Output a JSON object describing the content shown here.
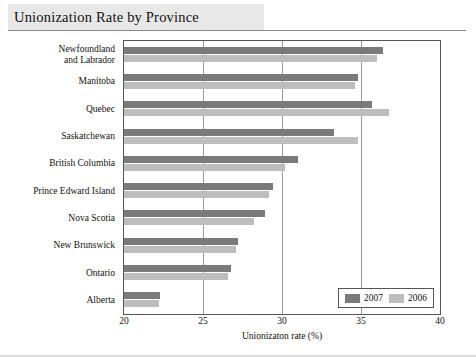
{
  "header": {
    "title": "Unionization Rate by Province"
  },
  "legend": {
    "items": [
      {
        "label": "2007",
        "color": "#7a7a7a"
      },
      {
        "label": "2006",
        "color": "#bdbdbd"
      }
    ]
  },
  "chart_data": {
    "type": "bar",
    "orientation": "horizontal",
    "title": "Unionization Rate by Province",
    "xlabel": "Unionizaton rate (%)",
    "ylabel": "",
    "xlim": [
      20,
      40
    ],
    "xticks": [
      20,
      25,
      30,
      35,
      40
    ],
    "xtick_labels": [
      "20",
      "25",
      "30",
      "35",
      "40"
    ],
    "grid": true,
    "legend_position": "bottom-right",
    "categories": [
      "Newfoundland\nand Labrador",
      "Manitoba",
      "Quebec",
      "Saskatchewan",
      "British Columbia",
      "Prince Edward Island",
      "Nova Scotia",
      "New Brunswick",
      "Ontario",
      "Alberta"
    ],
    "series": [
      {
        "name": "2007",
        "color": "#7a7a7a",
        "values": [
          36.4,
          34.8,
          35.7,
          33.3,
          31.0,
          29.4,
          28.9,
          27.2,
          26.8,
          22.3
        ]
      },
      {
        "name": "2006",
        "color": "#bdbdbd",
        "values": [
          36.0,
          34.6,
          36.8,
          34.8,
          30.2,
          29.2,
          28.2,
          27.1,
          26.6,
          22.2
        ]
      }
    ]
  }
}
